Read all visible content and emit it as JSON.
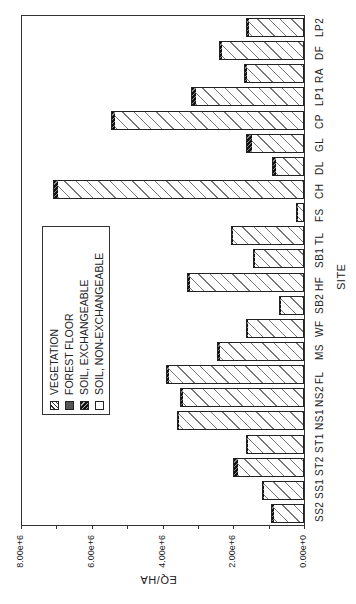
{
  "chart_data": {
    "type": "bar",
    "orientation": "rotated-90 (bars extend leftward from zero on right)",
    "title": "",
    "xlabel": "SITE",
    "ylabel": "EQ/HA",
    "ylim": [
      0,
      8000000
    ],
    "yticks": [
      "0.00e+0",
      "2.00e+6",
      "4.00e+6",
      "6.00e+6",
      "8.00e+6"
    ],
    "grid": false,
    "legend_position": "inside, upper-left of plot (rotated)",
    "categories": [
      "SS2",
      "SS1",
      "ST2",
      "ST1",
      "NS1",
      "NS2",
      "FL",
      "MS",
      "WF",
      "SB2",
      "HF",
      "SB1",
      "TL",
      "FS",
      "CH",
      "DL",
      "GL",
      "CP",
      "LP1",
      "RA",
      "DF",
      "LP2"
    ],
    "series": [
      {
        "name": "VEGETATION",
        "values": [
          0,
          0,
          0,
          0,
          0,
          0,
          0,
          0,
          0,
          0,
          0,
          0,
          0,
          0,
          0,
          0,
          0,
          0,
          0,
          0,
          0,
          0
        ]
      },
      {
        "name": "FOREST FLOOR",
        "values": [
          0,
          0,
          0,
          0,
          0,
          0,
          0,
          0,
          0,
          0,
          0,
          0,
          0,
          0,
          0,
          0,
          0,
          0,
          0,
          0,
          0,
          0
        ]
      },
      {
        "name": "SOIL, EXCHANGEABLE",
        "values": [
          20000.0,
          20000.0,
          100000.0,
          30000.0,
          30000.0,
          50000.0,
          30000.0,
          30000.0,
          20000.0,
          20000.0,
          30000.0,
          20000.0,
          30000.0,
          30000.0,
          120000.0,
          70000.0,
          150000.0,
          70000.0,
          120000.0,
          50000.0,
          30000.0,
          70000.0
        ]
      },
      {
        "name": "SOIL, NON-EXCHANGEABLE",
        "values": [
          900000.0,
          1180000.0,
          1900000.0,
          1620000.0,
          3570000.0,
          3450000.0,
          3870000.0,
          2420000.0,
          1630000.0,
          700000.0,
          3270000.0,
          1430000.0,
          2040000.0,
          200000.0,
          6980000.0,
          830000.0,
          1500000.0,
          5380000.0,
          3080000.0,
          1650000.0,
          2370000.0,
          1580000.0
        ]
      }
    ],
    "totals": [
      920000.0,
      1200000.0,
      2000000.0,
      1650000.0,
      3600000.0,
      3500000.0,
      3900000.0,
      2450000.0,
      1650000.0,
      720000.0,
      3300000.0,
      1450000.0,
      2070000.0,
      230000.0,
      7100000.0,
      900000.0,
      1650000.0,
      5450000.0,
      3200000.0,
      1700000.0,
      2400000.0,
      1650000.0
    ]
  },
  "legend": {
    "items": [
      {
        "label": "VEGETATION",
        "swatch": "hatch-diagonal"
      },
      {
        "label": "FOREST FLOOR",
        "swatch": "dark-gray"
      },
      {
        "label": "SOIL, EXCHANGEABLE",
        "swatch": "dark-hatch"
      },
      {
        "label": "SOIL, NON-EXCHANGEABLE",
        "swatch": "light-dash-pattern"
      }
    ]
  },
  "axis": {
    "x_title": "SITE",
    "y_title": "EQ/HA",
    "y_tick_labels": [
      "8.00e+6",
      "6.00e+6",
      "4.00e+6",
      "2.00e+6",
      "0.00e+0"
    ]
  }
}
